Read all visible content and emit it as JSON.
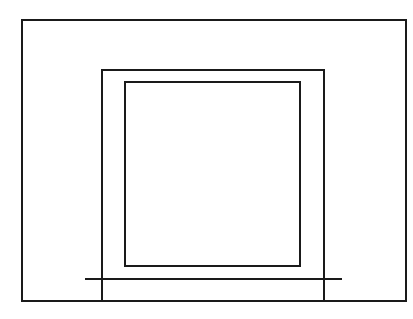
{
  "diagram": {
    "type": "line-drawing",
    "stroke_color": "#1a1a1a",
    "background_color": "#ffffff",
    "canvas": {
      "width": 413,
      "height": 319
    },
    "shapes": {
      "outer_rect": {
        "x": 22,
        "y": 20,
        "width": 384,
        "height": 281
      },
      "frame": {
        "left": 102,
        "top": 70,
        "right": 324,
        "bottom": 301,
        "open_bottom": true
      },
      "inner_rect": {
        "x": 125,
        "y": 82,
        "width": 175,
        "height": 184
      },
      "baseline": {
        "x1": 86,
        "y1": 279,
        "x2": 341,
        "y2": 279
      }
    }
  }
}
